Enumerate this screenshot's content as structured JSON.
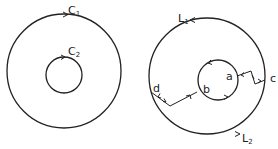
{
  "figure": {
    "left": {
      "outer_contour": {
        "label": "C",
        "subscript": "1",
        "direction": "counterclockwise"
      },
      "inner_contour": {
        "label": "C",
        "subscript": "2",
        "direction": "counterclockwise"
      }
    },
    "right": {
      "outer_arcs": [
        {
          "label": "L",
          "subscript": "1",
          "position": "top"
        },
        {
          "label": "L",
          "subscript": "2",
          "position": "bottom"
        }
      ],
      "points": {
        "a": "a",
        "b": "b",
        "c": "c",
        "d": "d"
      },
      "cuts": [
        {
          "from": "a",
          "to": "c",
          "description": "zig-zag cut with opposing arrows"
        },
        {
          "from": "d",
          "to": "b",
          "description": "zig-zag cut with opposing arrows"
        }
      ]
    }
  },
  "colors": {
    "ink": "#222222",
    "background": "#ffffff"
  }
}
